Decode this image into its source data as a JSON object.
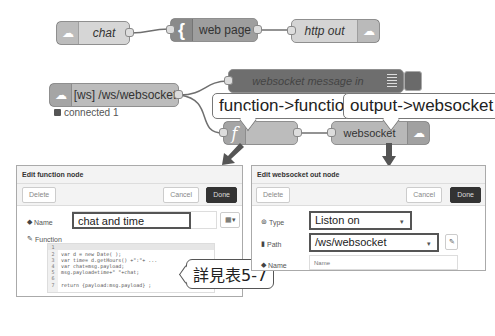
{
  "flow": {
    "nodes": {
      "chat": {
        "label": "chat",
        "icon": "http-in-icon"
      },
      "web_page": {
        "label": "web page",
        "icon": "template-brace-icon",
        "icon_glyph": "{"
      },
      "http_out": {
        "label": "http out",
        "icon": "http-out-icon"
      },
      "ws_in": {
        "label": "[ws] /ws/websocket",
        "icon": "websocket-icon",
        "status": "connected 1"
      },
      "debug": {
        "label": "websocket message in",
        "icon": "debug-list-icon"
      },
      "function": {
        "label": "",
        "icon": "function-icon",
        "icon_glyph": "f"
      },
      "ws_out": {
        "label": "websocket",
        "icon": "websocket-icon"
      }
    },
    "callouts": {
      "function": "function->function",
      "output": "output->websocket",
      "note": "詳見表5-7"
    }
  },
  "function_dialog": {
    "title": "Edit function node",
    "delete_label": "Delete",
    "cancel_label": "Cancel",
    "done_label": "Done",
    "name_label": "Name",
    "name_value": "chat and time",
    "function_label": "Function",
    "code": [
      {
        "n": "1",
        "text": ""
      },
      {
        "n": "2",
        "text": "var d = new Date( );"
      },
      {
        "n": "3",
        "text": "var time= d.getHours() +\":\"+ ..."
      },
      {
        "n": "4",
        "text": "var chat=msg.payload;"
      },
      {
        "n": "5",
        "text": "msg.payload=time+\" \"+chat;"
      },
      {
        "n": "6",
        "text": ""
      },
      {
        "n": "7",
        "text": "return {payload:msg.payload} ;"
      }
    ]
  },
  "ws_dialog": {
    "title": "Edit websocket out node",
    "delete_label": "Delete",
    "cancel_label": "Cancel",
    "done_label": "Done",
    "type_label": "Type",
    "type_value": "Liston on",
    "path_label": "Path",
    "path_value": "/ws/websocket",
    "name_label": "Name",
    "name_placeholder": "Name"
  },
  "colors": {
    "wire": "#6f6f6f",
    "arrow": "#555555",
    "done_button": "#333333"
  }
}
